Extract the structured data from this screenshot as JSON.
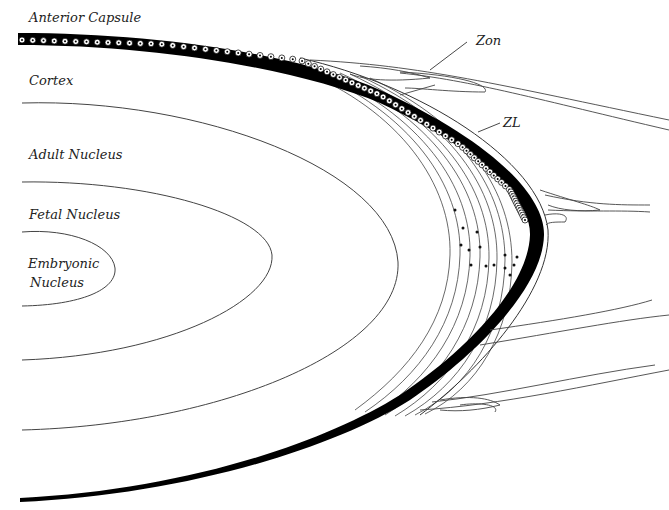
{
  "diagram": {
    "labels": {
      "anterior_capsule": "Anterior Capsule",
      "cortex": "Cortex",
      "adult_nucleus": "Adult Nucleus",
      "fetal_nucleus": "Fetal Nucleus",
      "embryonic_nucleus_line1": "Embryonic",
      "embryonic_nucleus_line2": "Nucleus",
      "zonules": "Zon",
      "zonular_lamella": "ZL"
    },
    "colors": {
      "background": "#ffffff",
      "capsule": "#000000",
      "line": "#333333"
    }
  }
}
